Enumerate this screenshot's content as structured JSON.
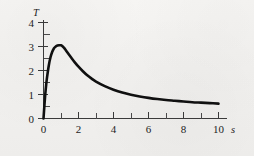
{
  "figure": {
    "background_color": "#f4f3f1",
    "curve_color": "#101010",
    "axis_color": "#3a3a3a"
  },
  "chart_data": {
    "type": "line",
    "title": "",
    "xlabel": "s",
    "ylabel": "T",
    "xlim": [
      0,
      10.6
    ],
    "ylim": [
      0,
      4.45
    ],
    "grid": false,
    "legend": null,
    "x_ticks_major": [
      0,
      2,
      4,
      6,
      8,
      10
    ],
    "x_ticks_major_labels": [
      "0",
      "2",
      "4",
      "6",
      "8",
      "10"
    ],
    "x_ticks_minor": [
      1,
      3,
      5,
      7,
      9
    ],
    "y_ticks_major": [
      0,
      1,
      2,
      3,
      4
    ],
    "y_ticks_major_labels": [
      "0",
      "1",
      "2",
      "3",
      "4"
    ],
    "y_ticks_minor": [
      0.5,
      1.5,
      2.5,
      3.5
    ],
    "series": [
      {
        "name": "T",
        "x": [
          0,
          0.05,
          0.1,
          0.15,
          0.2,
          0.3,
          0.4,
          0.5,
          0.6,
          0.7,
          0.8,
          0.9,
          1.0,
          1.1,
          1.2,
          1.4,
          1.6,
          1.8,
          2.0,
          2.25,
          2.5,
          2.75,
          3.0,
          3.5,
          4.0,
          4.5,
          5.0,
          5.5,
          6.0,
          6.5,
          7.0,
          7.5,
          8.0,
          8.5,
          9.0,
          9.5,
          10.0
        ],
        "y": [
          0.0,
          0.52,
          1.0,
          1.38,
          1.7,
          2.2,
          2.55,
          2.78,
          2.93,
          3.0,
          3.04,
          3.05,
          3.05,
          3.0,
          2.92,
          2.72,
          2.52,
          2.33,
          2.16,
          1.97,
          1.8,
          1.66,
          1.54,
          1.35,
          1.2,
          1.08,
          0.99,
          0.92,
          0.86,
          0.81,
          0.77,
          0.74,
          0.71,
          0.68,
          0.66,
          0.64,
          0.62
        ]
      }
    ],
    "annotations": {
      "peak_value": 3.05,
      "peak_x": 1.0,
      "end_value": 0.62,
      "start_value": 0.0
    }
  },
  "axis_labels": {
    "y_axis_symbol": "T",
    "x_axis_symbol": "s"
  }
}
